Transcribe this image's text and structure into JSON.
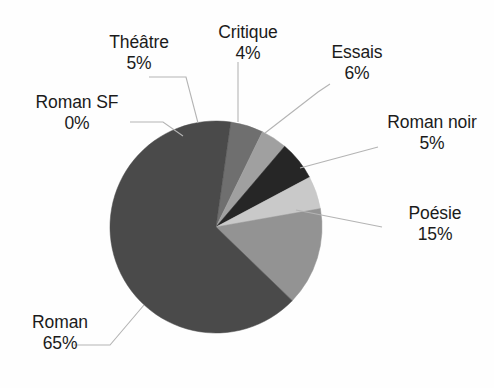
{
  "chart_data": {
    "type": "pie",
    "title": "",
    "categories": [
      "Théâtre",
      "Critique",
      "Essais",
      "Roman noir",
      "Poésie",
      "Roman",
      "Roman SF"
    ],
    "values": [
      5,
      4,
      6,
      5,
      15,
      65,
      0
    ],
    "value_unit": "%",
    "legend": "none",
    "grid": false,
    "slices": [
      {
        "label": "Théâtre",
        "value": 5,
        "value_text": "5%",
        "color": "#6f6f6f",
        "start_deg": 8,
        "end_deg": 26
      },
      {
        "label": "Critique",
        "value": 4,
        "value_text": "4%",
        "color": "#a0a0a0",
        "start_deg": 26,
        "end_deg": 40.4
      },
      {
        "label": "Essais",
        "value": 6,
        "value_text": "6%",
        "color": "#262626",
        "start_deg": 40.4,
        "end_deg": 62
      },
      {
        "label": "Roman noir",
        "value": 5,
        "value_text": "5%",
        "color": "#c9c9c9",
        "start_deg": 62,
        "end_deg": 80
      },
      {
        "label": "Poésie",
        "value": 15,
        "value_text": "15%",
        "color": "#939393",
        "start_deg": 80,
        "end_deg": 134
      },
      {
        "label": "Roman",
        "value": 65,
        "value_text": "65%",
        "color": "#4a4a4a",
        "start_deg": 134,
        "end_deg": 368
      },
      {
        "label": "Roman SF",
        "value": 0,
        "value_text": "0%",
        "color": "#8a8a8a",
        "start_deg": 8,
        "end_deg": 8
      }
    ]
  },
  "labels": {
    "theatre": {
      "name": "Théâtre",
      "pct": "5%"
    },
    "critique": {
      "name": "Critique",
      "pct": "4%"
    },
    "essais": {
      "name": "Essais",
      "pct": "6%"
    },
    "roman_sf": {
      "name": "Roman SF",
      "pct": "0%"
    },
    "roman_noir": {
      "name": "Roman noir",
      "pct": "5%"
    },
    "poesie": {
      "name": "Poésie",
      "pct": "15%"
    },
    "roman": {
      "name": "Roman",
      "pct": "65%"
    }
  },
  "style": {
    "background": "#fefefe",
    "text_color": "#1b1b1b",
    "leader_color": "#b4b4b4"
  },
  "geometry": {
    "cx": 216,
    "cy": 227,
    "r": 106
  }
}
